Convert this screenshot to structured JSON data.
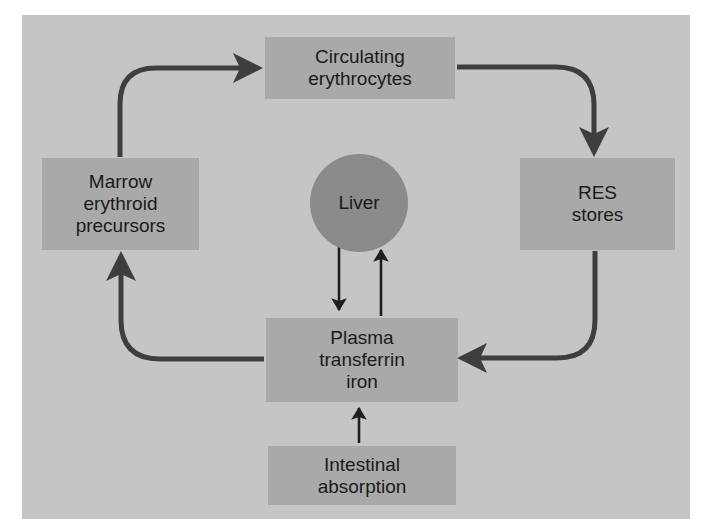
{
  "diagram": {
    "nodes": {
      "circulating": {
        "label": "Circulating\nerythrocytes"
      },
      "res": {
        "label": "RES\nstores"
      },
      "plasma": {
        "label": "Plasma\ntransferrin\niron"
      },
      "marrow": {
        "label": "Marrow\nerythroid\nprecursors"
      },
      "liver": {
        "label": "Liver"
      },
      "intestinal": {
        "label": "Intestinal\nabsorption"
      }
    },
    "edges": [
      {
        "from": "Circulating erythrocytes",
        "to": "RES stores"
      },
      {
        "from": "RES stores",
        "to": "Plasma transferrin iron"
      },
      {
        "from": "Plasma transferrin iron",
        "to": "Marrow erythroid precursors"
      },
      {
        "from": "Marrow erythroid precursors",
        "to": "Circulating erythrocytes"
      },
      {
        "from": "Liver",
        "to": "Plasma transferrin iron"
      },
      {
        "from": "Plasma transferrin iron",
        "to": "Liver"
      },
      {
        "from": "Intestinal absorption",
        "to": "Plasma transferrin iron"
      }
    ],
    "colors": {
      "background": "#c5c5c5",
      "box": "#a9a9a9",
      "liver": "#8b8b8b",
      "arrow": "#3e3e3e",
      "thin_arrow": "#1e1e1e"
    }
  }
}
